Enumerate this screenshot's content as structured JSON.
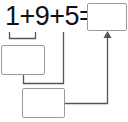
{
  "equation": {
    "expression": "1+9+5=",
    "terms": [
      "1",
      "9",
      "5"
    ],
    "operators": [
      "+",
      "+",
      "="
    ]
  },
  "boxes": {
    "answer": "",
    "first_sum": "",
    "second_sum": ""
  },
  "colors": {
    "line": "#555555",
    "box_border": "#9a9a9a",
    "text": "#111111"
  }
}
